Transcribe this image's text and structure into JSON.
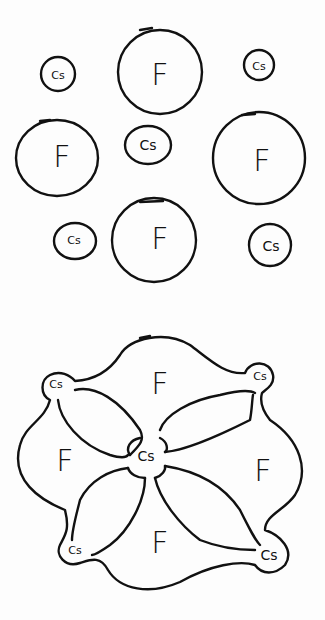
{
  "diagram": {
    "colors": {
      "background": "#fdfdfd",
      "ink": "#111111"
    },
    "top_panel": {
      "name": "separated-ions",
      "atoms": [
        {
          "label": "Cs",
          "cx": 58,
          "cy": 74,
          "r": 17
        },
        {
          "label": "F",
          "cx": 160,
          "cy": 72,
          "r": 42
        },
        {
          "label": "Cs",
          "cx": 259,
          "cy": 65,
          "r": 15
        },
        {
          "label": "F",
          "cx": 57,
          "cy": 158,
          "r": 41
        },
        {
          "label": "Cs",
          "cx": 148,
          "cy": 145,
          "r": 22
        },
        {
          "label": "F",
          "cx": 259,
          "cy": 158,
          "r": 46
        },
        {
          "label": "Cs",
          "cx": 75,
          "cy": 241,
          "r": 20
        },
        {
          "label": "F",
          "cx": 154,
          "cy": 240,
          "r": 42
        },
        {
          "label": "Cs",
          "cx": 270,
          "cy": 245,
          "r": 21
        }
      ]
    },
    "bottom_panel": {
      "name": "bonded-lattice",
      "labels": [
        {
          "label": "F",
          "x": 160,
          "y": 383
        },
        {
          "label": "Cs",
          "x": 56,
          "y": 384
        },
        {
          "label": "Cs",
          "x": 260,
          "y": 376
        },
        {
          "label": "F",
          "x": 65,
          "y": 460
        },
        {
          "label": "Cs",
          "x": 146,
          "y": 456
        },
        {
          "label": "F",
          "x": 263,
          "y": 470
        },
        {
          "label": "Cs",
          "x": 75,
          "y": 550
        },
        {
          "label": "F",
          "x": 160,
          "y": 542
        },
        {
          "label": "Cs",
          "x": 269,
          "y": 555
        }
      ]
    }
  }
}
